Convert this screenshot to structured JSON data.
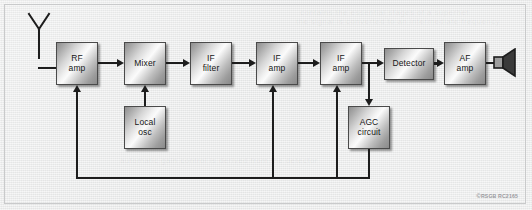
{
  "figure": {
    "copyright_symbol": "©",
    "copyright_text": "RSGB RC2165",
    "background_color": "#e8e8e8",
    "wire_color": "#1d1d1d",
    "block_border_color": "#4a4a4a"
  },
  "ghost_text": {
    "line1": "contains the essential stages of a superhet",
    "line2": "the signal is converted to an intermediate frequency",
    "line3": "automatic gain control is derived from the detector"
  },
  "icons": {
    "antenna": "antenna-icon",
    "speaker": "speaker-icon"
  },
  "blocks": [
    {
      "id": "rf-amp",
      "line1": "RF",
      "line2": "amp"
    },
    {
      "id": "mixer",
      "line1": "Mixer",
      "line2": ""
    },
    {
      "id": "if-filter",
      "line1": "IF",
      "line2": "filter"
    },
    {
      "id": "if-amp-1",
      "line1": "IF",
      "line2": "amp"
    },
    {
      "id": "if-amp-2",
      "line1": "IF",
      "line2": "amp"
    },
    {
      "id": "detector",
      "line1": "Detector",
      "line2": ""
    },
    {
      "id": "af-amp",
      "line1": "AF",
      "line2": "amp"
    },
    {
      "id": "local-osc",
      "line1": "Local",
      "line2": "osc"
    },
    {
      "id": "agc-circuit",
      "line1": "AGC",
      "line2": "circuit"
    }
  ],
  "signal_chain": [
    "antenna",
    "rf-amp",
    "mixer",
    "if-filter",
    "if-amp-1",
    "if-amp-2",
    "detector",
    "af-amp",
    "speaker"
  ],
  "connections": [
    {
      "from": "antenna",
      "to": "rf-amp",
      "kind": "signal"
    },
    {
      "from": "rf-amp",
      "to": "mixer",
      "kind": "signal"
    },
    {
      "from": "mixer",
      "to": "if-filter",
      "kind": "signal"
    },
    {
      "from": "if-filter",
      "to": "if-amp-1",
      "kind": "signal"
    },
    {
      "from": "if-amp-1",
      "to": "if-amp-2",
      "kind": "signal"
    },
    {
      "from": "if-amp-2",
      "to": "detector",
      "kind": "signal"
    },
    {
      "from": "detector",
      "to": "af-amp",
      "kind": "signal"
    },
    {
      "from": "af-amp",
      "to": "speaker",
      "kind": "signal"
    },
    {
      "from": "local-osc",
      "to": "mixer",
      "kind": "injection"
    },
    {
      "from": "if-amp-2",
      "to": "agc-circuit",
      "kind": "agc-tap"
    },
    {
      "from": "agc-circuit",
      "to": "rf-amp",
      "kind": "agc-feedback"
    },
    {
      "from": "agc-circuit",
      "to": "if-amp-1",
      "kind": "agc-feedback"
    },
    {
      "from": "agc-circuit",
      "to": "if-amp-2",
      "kind": "agc-feedback"
    }
  ]
}
